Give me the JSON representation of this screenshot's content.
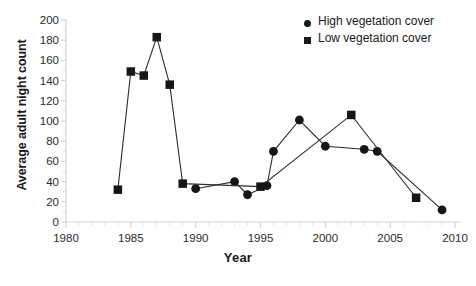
{
  "chart_data": {
    "type": "scatter",
    "title": "",
    "xlabel": "Year",
    "ylabel": "Average adult night count",
    "xlim": [
      1980,
      2010
    ],
    "ylim": [
      0,
      200
    ],
    "ytick_step": 20,
    "xtick_step": 5,
    "grid": false,
    "legend_position": "top-right",
    "xticks": [
      "1980",
      "1985",
      "1990",
      "1995",
      "2000",
      "2005",
      "2010"
    ],
    "yticks": [
      "0",
      "20",
      "40",
      "60",
      "80",
      "100",
      "120",
      "140",
      "160",
      "180",
      "200"
    ],
    "series": [
      {
        "name": "High vegetation cover",
        "marker": "circle",
        "connected": true,
        "points": [
          {
            "x": 1990,
            "y": 33
          },
          {
            "x": 1993,
            "y": 40
          },
          {
            "x": 1994,
            "y": 27
          },
          {
            "x": 1995.5,
            "y": 36
          },
          {
            "x": 1996,
            "y": 70
          },
          {
            "x": 1998,
            "y": 101
          },
          {
            "x": 2000,
            "y": 75
          },
          {
            "x": 2003,
            "y": 72
          },
          {
            "x": 2004,
            "y": 70
          },
          {
            "x": 2009,
            "y": 12
          }
        ]
      },
      {
        "name": "Low vegetation cover",
        "marker": "square",
        "connected": true,
        "points": [
          {
            "x": 1984,
            "y": 32
          },
          {
            "x": 1985,
            "y": 149
          },
          {
            "x": 1986,
            "y": 145
          },
          {
            "x": 1987,
            "y": 183
          },
          {
            "x": 1988,
            "y": 136
          },
          {
            "x": 1989,
            "y": 38
          },
          {
            "x": 1995,
            "y": 35
          },
          {
            "x": 2002,
            "y": 106
          },
          {
            "x": 2007,
            "y": 24
          }
        ]
      }
    ]
  },
  "legend": {
    "entries": [
      {
        "label": "High vegetation cover",
        "marker": "circle"
      },
      {
        "label": "Low vegetation cover",
        "marker": "square"
      }
    ]
  },
  "caption": {
    "text": ""
  }
}
